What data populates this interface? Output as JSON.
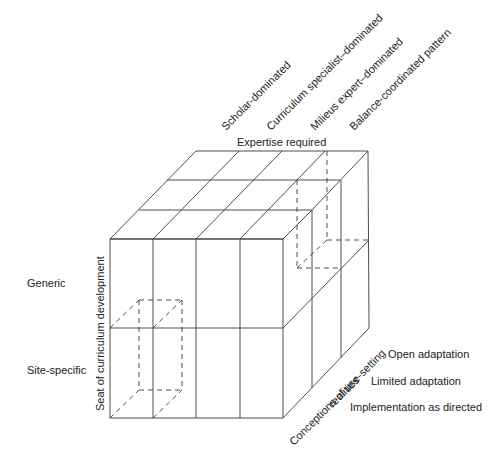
{
  "diagram": {
    "axes": {
      "top": {
        "label": "Expertise required",
        "categories": [
          "Scholar-dominated",
          "Curriculum specialist–dominated",
          "Milieus expert–dominated",
          "Balance-coordinated pattern"
        ]
      },
      "left": {
        "label": "Seat of curriculum development",
        "categories": [
          "Generic",
          "Site-specific"
        ]
      },
      "depth": {
        "label_line1": "Conceptions of use-setting",
        "label_line2": "realities",
        "categories": [
          "Open adaptation",
          "Limited adaptation",
          "Implementation as directed"
        ]
      }
    },
    "grid": {
      "columns": 4,
      "rows": 2,
      "depth": 3
    }
  }
}
